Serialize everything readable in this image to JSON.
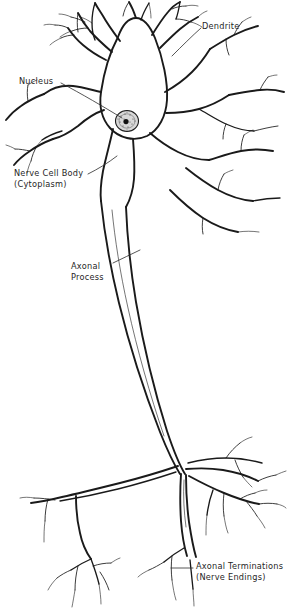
{
  "figure": {
    "name": "neuron-diagram",
    "background_color": "#ffffff",
    "ink_color": "#1a1a1a",
    "width": 287,
    "height": 613
  },
  "labels": {
    "dendrite": {
      "text": "Dendrite"
    },
    "nucleus": {
      "text": "Nucleus"
    },
    "cell_body": {
      "line1": "Nerve Cell Body",
      "line2": "(Cytoplasm)"
    },
    "axonal_process": {
      "line1": "Axonal",
      "line2": "Process"
    },
    "axonal_terminations": {
      "line1": "Axonal Terminations",
      "line2": "(Nerve Endings)"
    }
  },
  "parts": {
    "soma": "nerve-cell-body",
    "nucleus": "nucleus-oval",
    "nucleolus": "nucleolus-dot",
    "dendrites": "dendrite-branches",
    "axon": "axonal-process",
    "terminals": "axonal-terminations"
  }
}
